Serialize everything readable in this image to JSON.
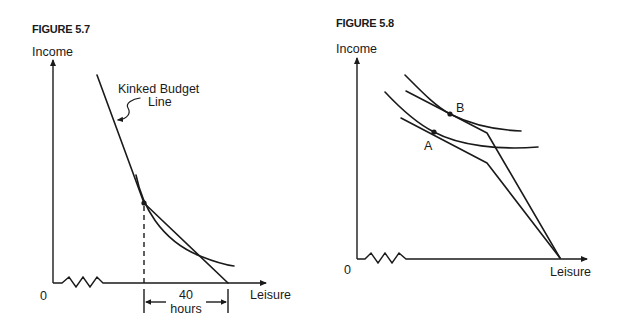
{
  "figures": [
    {
      "id": "figure-5-7",
      "title": "FIGURE 5.7",
      "y_axis_label": "Income",
      "x_axis_label": "Leisure",
      "origin_label": "0",
      "budget_line_label": [
        "Kinked Budget",
        "Line"
      ],
      "bracket_label": [
        "40",
        "hours"
      ],
      "axis_break": true,
      "elements": [
        "kinked budget line",
        "indifference curve tangent at kink",
        "dashed vertical line from kink to leisure axis",
        "40-hour bracket"
      ]
    },
    {
      "id": "figure-5-8",
      "title": "FIGURE 5.8",
      "y_axis_label": "Income",
      "x_axis_label": "Leisure",
      "origin_label": "0",
      "points": [
        "A",
        "B"
      ],
      "axis_break": true,
      "elements": [
        "upper kinked budget line",
        "lower kinked budget line",
        "upper indifference curve tangent at B",
        "lower indifference curve tangent at A"
      ]
    }
  ]
}
